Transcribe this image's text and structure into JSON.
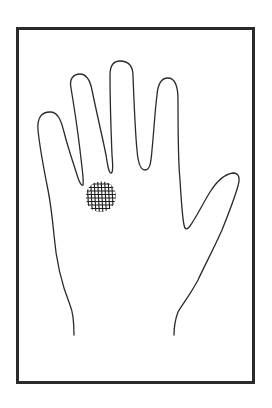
{
  "figure": {
    "colors": {
      "background": "#ffffff",
      "line": "#2a2a2a",
      "hatch": "#1e1e1e"
    },
    "labels": {
      "hand": "Hand outline",
      "spot": "Hatched spot"
    }
  }
}
